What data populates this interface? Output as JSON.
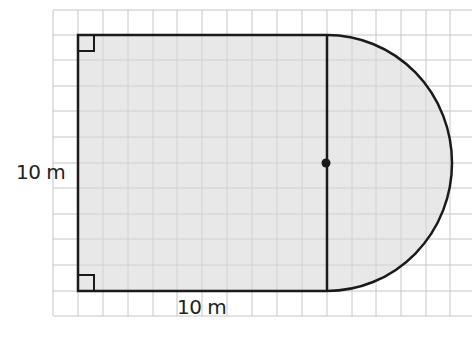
{
  "diagram": {
    "type": "composite-shape-area",
    "shape": {
      "square": {
        "side": "10 m",
        "right_angles": 2
      },
      "semicircle": {
        "diameter_side": "shared right edge of square",
        "center_marked": true
      }
    },
    "labels": {
      "left_side": "10 m",
      "bottom_side": "10 m"
    },
    "colors": {
      "fill": "#e4e4e4",
      "outline": "#1a1a1a",
      "grid": "#c4c4c4"
    }
  }
}
